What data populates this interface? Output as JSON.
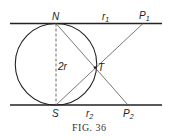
{
  "figure": {
    "caption": "FIG. 36",
    "labels": {
      "N": "N",
      "S": "S",
      "T": "T",
      "diameter": "2r",
      "r1": "r",
      "r1_sub": "1",
      "r2": "r",
      "r2_sub": "2",
      "P1": "P",
      "P1_sub": "1",
      "P2": "P",
      "P2_sub": "2"
    },
    "colors": {
      "stroke": "#222222",
      "background": "#ffffff"
    }
  }
}
